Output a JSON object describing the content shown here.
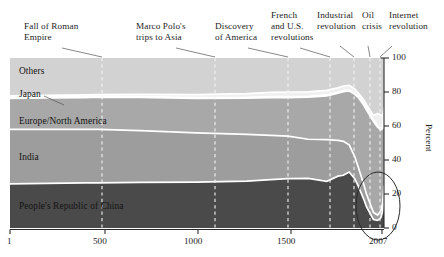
{
  "chart_data": {
    "type": "area",
    "title": "",
    "subtitle": "",
    "xlabel": "",
    "ylabel": "Percent",
    "xlim": [
      1,
      2007
    ],
    "ylim": [
      0,
      100
    ],
    "grid": "vertical-dashed-event-markers",
    "legend_position": "inline-band-labels",
    "stacked": true,
    "x_ticks": [
      "1",
      "500",
      "1000",
      "1500",
      "2007"
    ],
    "x_tick_values": [
      1,
      500,
      1000,
      1500,
      2007
    ],
    "y_ticks": [
      "0",
      "20",
      "40",
      "60",
      "80",
      "100"
    ],
    "y_tick_values": [
      0,
      20,
      40,
      60,
      80,
      100
    ],
    "x": [
      1,
      200,
      400,
      476,
      700,
      1000,
      1271,
      1400,
      1492,
      1600,
      1700,
      1760,
      1789,
      1820,
      1850,
      1870,
      1900,
      1913,
      1950,
      1973,
      1990,
      2000,
      2007
    ],
    "series": [
      {
        "name": "People's Republic of China",
        "label": "People's Republic of China",
        "color": "#4a4a4a",
        "values": [
          26.0,
          26.2,
          26.5,
          26.6,
          26.8,
          27.0,
          27.6,
          28.5,
          29.0,
          29.2,
          27.5,
          30.5,
          31.0,
          32.9,
          29.0,
          24.5,
          16.5,
          12.5,
          5.0,
          4.5,
          6.0,
          10.0,
          18.5
        ]
      },
      {
        "name": "India",
        "label": "India",
        "color": "#9d9d9d",
        "values": [
          32.0,
          31.8,
          31.5,
          31.4,
          30.5,
          29.0,
          27.5,
          26.0,
          25.0,
          23.0,
          24.5,
          21.0,
          20.0,
          16.0,
          13.0,
          11.0,
          8.5,
          7.5,
          4.2,
          3.1,
          4.0,
          4.8,
          6.5
        ]
      },
      {
        "name": "Europe/North America",
        "label": "Europe/North America",
        "color": "#a8a8a8",
        "values": [
          18.5,
          18.8,
          19.0,
          19.2,
          19.8,
          20.5,
          21.5,
          22.5,
          23.0,
          25.0,
          26.0,
          28.0,
          29.5,
          32.0,
          37.0,
          41.5,
          47.5,
          50.0,
          54.0,
          52.0,
          48.0,
          44.0,
          40.0
        ]
      },
      {
        "name": "Japan",
        "label": "Japan",
        "color": "#efefef",
        "values": [
          1.2,
          1.2,
          1.3,
          1.3,
          1.5,
          2.0,
          2.5,
          2.8,
          3.0,
          2.9,
          3.0,
          3.0,
          3.0,
          3.0,
          2.8,
          2.3,
          2.6,
          2.6,
          3.0,
          7.8,
          8.5,
          7.0,
          6.0
        ]
      },
      {
        "name": "Others",
        "label": "Others",
        "color": "#d2d2d2",
        "values": [
          22.3,
          22.0,
          21.7,
          21.5,
          21.4,
          21.5,
          20.9,
          20.2,
          20.0,
          19.9,
          19.0,
          17.5,
          16.5,
          16.1,
          18.2,
          20.7,
          24.9,
          27.4,
          33.8,
          32.6,
          33.5,
          34.2,
          29.0
        ]
      }
    ],
    "events": [
      {
        "label": "Fall of Roman Empire",
        "lines": [
          "Fall of Roman",
          "Empire"
        ],
        "year": 476,
        "x_px": 102
      },
      {
        "label": "Marco Polo's trips to Asia",
        "lines": [
          "Marco Polo's",
          "trips to Asia"
        ],
        "year": 1271,
        "x_px": 215
      },
      {
        "label": "Discovery of America",
        "lines": [
          "Discovery",
          "of America"
        ],
        "year": 1492,
        "x_px": 288
      },
      {
        "label": "French and U.S. revolutions",
        "lines": [
          "French",
          "and U.S.",
          "revolutions"
        ],
        "year": 1789,
        "x_px": 330
      },
      {
        "label": "Industrial revolution",
        "lines": [
          "Industrial",
          "revolution"
        ],
        "year": 1820,
        "x_px": 354
      },
      {
        "label": "Oil crisis",
        "lines": [
          "Oil",
          "crisis"
        ],
        "year": 1973,
        "x_px": 370
      },
      {
        "label": "Internet revolution",
        "lines": [
          "Internet",
          "revolution"
        ],
        "year": 1995,
        "x_px": 380
      }
    ],
    "highlight": {
      "shape": "ellipse",
      "note": ""
    }
  },
  "annotations": {
    "event_0_line_0": "Fall of Roman",
    "event_0_line_1": "Empire",
    "event_1_line_0": "Marco Polo's",
    "event_1_line_1": "trips to Asia",
    "event_2_line_0": "Discovery",
    "event_2_line_1": "of America",
    "event_3_line_0": "French",
    "event_3_line_1": "and U.S.",
    "event_3_line_2": "revolutions",
    "event_4_line_0": "Industrial",
    "event_4_line_1": "revolution",
    "event_5_line_0": "Oil",
    "event_5_line_1": "crisis",
    "event_6_line_0": "Internet",
    "event_6_line_1": "revolution"
  },
  "band_labels": {
    "others": "Others",
    "japan": "Japan",
    "europe_north_america": "Europe/North America",
    "india": "India",
    "china": "People's Republic of China"
  },
  "axis": {
    "y_label": "Percent",
    "y_100": "100",
    "y_80": "80",
    "y_60": "60",
    "y_40": "40",
    "y_20": "20",
    "y_0": "0",
    "x_1": "1",
    "x_500": "500",
    "x_1000": "1000",
    "x_1500": "1500",
    "x_2007": "2007"
  },
  "colors": {
    "china": "#4a4a4a",
    "india": "#9d9d9d",
    "europe": "#a8a8a8",
    "japan": "#efefef",
    "others": "#d2d2d2",
    "separator": "#ffffff",
    "background": "#ffffff",
    "text": "#1d1d1d"
  }
}
